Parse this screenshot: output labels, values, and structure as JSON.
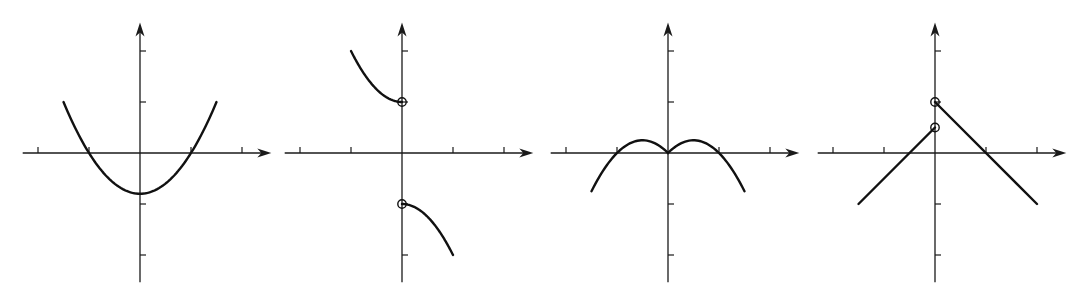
{
  "chart_data": [
    {
      "type": "line",
      "title": "",
      "xlabel": "x",
      "ylabel": "y",
      "xlim": [
        -2.3,
        2.3
      ],
      "ylim": [
        -2.3,
        2.4
      ],
      "x_ticks": [
        -2,
        -1,
        0,
        1,
        2
      ],
      "y_ticks": [
        -2,
        -1,
        1,
        2
      ],
      "x_tick_labels": [
        "−2",
        "−1",
        "0",
        "1",
        "2"
      ],
      "y_tick_labels": [
        "−2",
        "−1",
        "1",
        "2"
      ],
      "grid": false,
      "series": [
        {
          "name": "parabola",
          "kind": "function",
          "formula": "0.8*x^2 - 0.8",
          "domain": [
            -1.5,
            1.5
          ],
          "points": [
            [
              -1.5,
              1.0
            ],
            [
              -1,
              0
            ],
            [
              0,
              -0.8
            ],
            [
              1,
              0
            ],
            [
              1.5,
              1.0
            ]
          ]
        }
      ],
      "open_points": []
    },
    {
      "type": "line",
      "title": "",
      "xlabel": "x",
      "ylabel": "y",
      "xlim": [
        -2.3,
        2.3
      ],
      "ylim": [
        -2.3,
        2.4
      ],
      "x_ticks": [
        -2,
        -1,
        0,
        1,
        2
      ],
      "y_ticks": [
        -2,
        -1,
        1,
        2
      ],
      "x_tick_labels": [
        "−2",
        "−1",
        "0",
        "1",
        "2"
      ],
      "y_tick_labels": [
        "−2",
        "−1",
        "1",
        "2"
      ],
      "y_point_labels": [
        {
          "y": 1,
          "label": "1"
        }
      ],
      "grid": false,
      "series": [
        {
          "name": "upper-branch",
          "kind": "function",
          "formula": "x^2 + 1",
          "domain": [
            -1,
            0
          ],
          "points": [
            [
              -1,
              2
            ],
            [
              -0.5,
              1.25
            ],
            [
              0,
              1
            ]
          ]
        },
        {
          "name": "lower-branch",
          "kind": "function",
          "formula": "-x^2 - 1",
          "domain": [
            0,
            1
          ],
          "points": [
            [
              0,
              -1
            ],
            [
              0.5,
              -1.25
            ],
            [
              1,
              -2
            ]
          ]
        }
      ],
      "open_points": [
        [
          0,
          1
        ],
        [
          0,
          -1
        ]
      ]
    },
    {
      "type": "line",
      "title": "",
      "xlabel": "x",
      "ylabel": "y",
      "xlim": [
        -2.3,
        2.3
      ],
      "ylim": [
        -2.3,
        2.4
      ],
      "x_ticks": [
        -2,
        -1,
        0,
        1,
        2
      ],
      "y_ticks": [
        -2,
        -1,
        1,
        2
      ],
      "x_tick_labels": [
        "−2",
        "−1",
        "0",
        "1",
        "2"
      ],
      "y_tick_labels": [
        "−2",
        "−1",
        "1",
        "2"
      ],
      "grid": false,
      "series": [
        {
          "name": "double-hump",
          "kind": "function",
          "formula": "-x^2 + |x|",
          "domain": [
            -1.5,
            1.5
          ],
          "points": [
            [
              -1.5,
              -0.75
            ],
            [
              -1,
              0
            ],
            [
              -0.5,
              0.25
            ],
            [
              0,
              0
            ],
            [
              0.5,
              0.25
            ],
            [
              1,
              0
            ],
            [
              1.5,
              -0.75
            ]
          ]
        }
      ],
      "open_points": []
    },
    {
      "type": "line",
      "title": "",
      "xlabel": "x",
      "ylabel": "y",
      "xlim": [
        -2.3,
        2.3
      ],
      "ylim": [
        -2.3,
        2.4
      ],
      "x_ticks": [
        -2,
        -1,
        0,
        1,
        2
      ],
      "y_ticks": [
        -2,
        -1,
        1,
        2
      ],
      "x_tick_labels": [
        "−2",
        "−1",
        "0",
        "1",
        "2"
      ],
      "y_tick_labels": [
        "−2",
        "−1",
        "1",
        "2"
      ],
      "grid": false,
      "series": [
        {
          "name": "left-segment",
          "kind": "segment",
          "points": [
            [
              -1.5,
              -1
            ],
            [
              0,
              0.5
            ]
          ]
        },
        {
          "name": "right-segment",
          "kind": "segment",
          "points": [
            [
              0,
              1
            ],
            [
              2,
              -1
            ]
          ]
        }
      ],
      "open_points": [
        [
          0,
          1
        ],
        [
          0,
          0.5
        ]
      ]
    }
  ]
}
